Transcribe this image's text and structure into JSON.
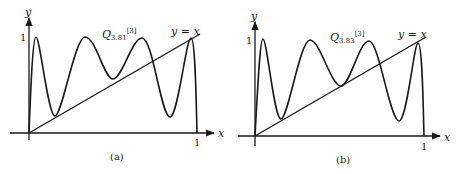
{
  "figure": {
    "panels": [
      {
        "id": "a",
        "caption": "(a)",
        "curve_label_main": "Q",
        "curve_label_sub": "3.81",
        "curve_label_sup": "[3]",
        "line_label": "y = x",
        "x_axis_label": "x",
        "y_axis_label": "y",
        "x_tick": "1",
        "y_tick": "1"
      },
      {
        "id": "b",
        "caption": "(b)",
        "curve_label_main": "Q",
        "curve_label_sub": "3.83",
        "curve_label_sup": "[3]",
        "line_label": "y = x",
        "x_axis_label": "x",
        "y_axis_label": "y",
        "x_tick": "1",
        "y_tick": "1"
      }
    ],
    "colors": {
      "ink": "#1a1a1a",
      "background": "#ffffff"
    }
  }
}
